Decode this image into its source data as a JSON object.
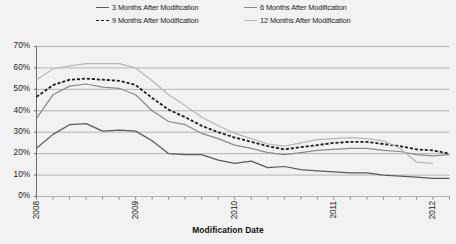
{
  "chart_data": {
    "type": "line",
    "title": "",
    "xlabel": "Modification Date",
    "ylabel": "",
    "ylim": [
      0,
      70
    ],
    "yticks": [
      0,
      10,
      20,
      30,
      40,
      50,
      60,
      70
    ],
    "ytick_labels": [
      "0%",
      "10%",
      "20%",
      "30%",
      "40%",
      "50%",
      "60%",
      "70%"
    ],
    "grid": true,
    "legend_position": "top",
    "x_axis_type": "date",
    "x_tick_count": 26,
    "xtick_labels": [
      "2008",
      "2009",
      "2010",
      "2011",
      "2012"
    ],
    "xtick_label_positions": [
      0,
      6,
      12,
      18,
      24
    ],
    "x": [
      0,
      1,
      2,
      3,
      4,
      5,
      6,
      7,
      8,
      9,
      10,
      11,
      12,
      13,
      14,
      15,
      16,
      17,
      18,
      19,
      20,
      21,
      22,
      23,
      24,
      25
    ],
    "series": [
      {
        "name": "3 Months After Modification",
        "color": "#5b5b5b",
        "style": "solid",
        "values": [
          22.5,
          29.0,
          33.5,
          34.0,
          30.5,
          31.0,
          30.5,
          26.0,
          20.0,
          19.5,
          19.5,
          17.0,
          15.5,
          16.5,
          13.5,
          14.0,
          12.5,
          12.0,
          11.5,
          11.0,
          11.0,
          10.0,
          9.5,
          9.0,
          8.5,
          8.5
        ]
      },
      {
        "name": "6 Months After Modification",
        "color": "#8a8a8a",
        "style": "solid",
        "values": [
          36.5,
          47.5,
          51.5,
          52.5,
          51.0,
          50.5,
          47.5,
          40.0,
          35.0,
          33.5,
          29.5,
          27.0,
          24.0,
          22.5,
          20.5,
          19.5,
          20.5,
          21.5,
          22.0,
          22.5,
          22.5,
          21.5,
          21.0,
          19.5,
          19.0,
          19.5
        ]
      },
      {
        "name": "9 Months After Modification",
        "color": "#1d1d1d",
        "style": "dashed",
        "values": [
          46.5,
          52.0,
          54.5,
          55.0,
          54.5,
          54.0,
          52.0,
          46.0,
          40.5,
          37.0,
          33.0,
          30.0,
          27.5,
          25.5,
          23.5,
          22.0,
          23.0,
          24.0,
          25.0,
          25.5,
          25.5,
          24.5,
          23.5,
          22.0,
          21.5,
          20.0
        ]
      },
      {
        "name": "12 Months After Modification",
        "color": "#b8b8b8",
        "style": "solid",
        "values": [
          54.5,
          59.5,
          61.0,
          62.0,
          62.0,
          62.0,
          60.0,
          54.0,
          47.5,
          42.5,
          37.0,
          33.0,
          29.5,
          27.0,
          24.5,
          23.5,
          25.0,
          26.5,
          27.0,
          27.5,
          27.0,
          26.0,
          22.5,
          16.0,
          15.5,
          null
        ]
      }
    ]
  },
  "axes": {
    "x_title": "Modification Date"
  },
  "legend": {
    "items": [
      {
        "label": "3 Months After Modification",
        "color": "#5b5b5b",
        "style": "solid"
      },
      {
        "label": "6 Months After Modification",
        "color": "#8a8a8a",
        "style": "solid"
      },
      {
        "label": "9 Months After Modification",
        "color": "#1d1d1d",
        "style": "dashed"
      },
      {
        "label": "12 Months After Modification",
        "color": "#b8b8b8",
        "style": "solid"
      }
    ]
  }
}
